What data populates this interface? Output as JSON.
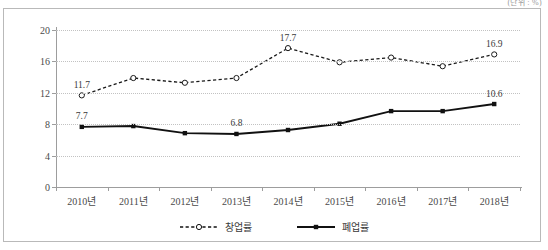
{
  "unit_note": "(단위 : %)",
  "chart_data": {
    "type": "line",
    "title": "",
    "subtitle": "",
    "xlabel": "",
    "ylabel": "",
    "unit": "%",
    "grid": true,
    "legend_position": "bottom",
    "ylim": [
      0,
      20
    ],
    "yticks": [
      0,
      4,
      8,
      12,
      16,
      20
    ],
    "ytick_labels": [
      "0",
      "4",
      "8",
      "12",
      "16",
      "20"
    ],
    "categories": [
      "2010년",
      "2011년",
      "2012년",
      "2013년",
      "2014년",
      "2015년",
      "2016년",
      "2017년",
      "2018년"
    ],
    "series": [
      {
        "name": "창업률",
        "style": "dashed",
        "marker": "open-circle",
        "color": "#1a1a1a",
        "values": [
          11.7,
          13.9,
          13.3,
          13.9,
          17.7,
          15.9,
          16.5,
          15.4,
          16.9
        ],
        "labels": [
          {
            "index": 0,
            "text": "11.7"
          },
          {
            "index": 4,
            "text": "17.7"
          },
          {
            "index": 8,
            "text": "16.9"
          }
        ]
      },
      {
        "name": "폐업률",
        "style": "solid",
        "marker": "filled-square",
        "color": "#111111",
        "values": [
          7.7,
          7.8,
          6.9,
          6.8,
          7.3,
          8.1,
          9.7,
          9.7,
          10.6
        ],
        "labels": [
          {
            "index": 0,
            "text": "7.7"
          },
          {
            "index": 3,
            "text": "6.8"
          },
          {
            "index": 8,
            "text": "10.6"
          }
        ]
      }
    ]
  },
  "legend": [
    {
      "label": "창업률",
      "marker": "open-circle",
      "style": "dashed"
    },
    {
      "label": "폐업률",
      "marker": "filled-square",
      "style": "solid"
    }
  ]
}
